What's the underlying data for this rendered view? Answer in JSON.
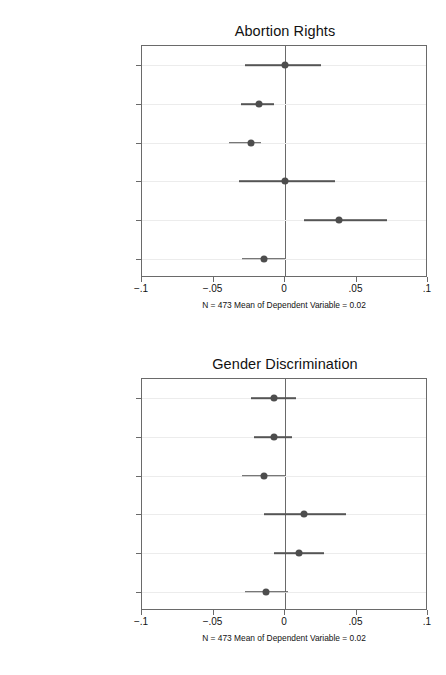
{
  "figure": {
    "categories": [
      "Female, Same Party",
      "Male, Different Party",
      "Male, Same Party",
      "Nominee Qualifications",
      "Nominee Judge",
      "Senator Relection Year"
    ],
    "xticks": [
      "−.1",
      "−.05",
      "0",
      ".05",
      ".1"
    ],
    "xtickvalues": [
      -0.1,
      -0.05,
      0,
      0.05,
      0.1
    ],
    "note": "N = 473 Mean of Dependent Variable = 0.02",
    "colors": {
      "point": "#4d4d4d",
      "interval": "#555555",
      "axis": "#6a6a6a",
      "grid": "#ececec",
      "text": "#111111",
      "background": "#ffffff"
    }
  },
  "chart_data": [
    {
      "type": "scatter",
      "title": "Abortion Rights",
      "xlabel": "",
      "ylabel": "",
      "xlim": [
        -0.1,
        0.1
      ],
      "grid": true,
      "legend": "none",
      "orientation": "horizontal",
      "annotation": "N = 473 Mean of Dependent Variable = 0.02",
      "categories": [
        "Female, Same Party",
        "Male, Different Party",
        "Male, Same Party",
        "Nominee Qualifications",
        "Nominee Judge",
        "Senator Relection Year"
      ],
      "values": [
        0.0,
        -0.018,
        -0.024,
        0.0,
        0.038,
        -0.015
      ],
      "ci_low": [
        -0.028,
        -0.031,
        -0.039,
        -0.032,
        0.013,
        -0.03
      ],
      "ci_high": [
        0.025,
        -0.008,
        -0.017,
        0.035,
        0.071,
        0.0
      ],
      "xticks": [
        -0.1,
        -0.05,
        0,
        0.05,
        0.1
      ],
      "xticklabels": [
        "−.1",
        "−.05",
        "0",
        ".05",
        ".1"
      ]
    },
    {
      "type": "scatter",
      "title": "Gender Discrimination",
      "xlabel": "",
      "ylabel": "",
      "xlim": [
        -0.1,
        0.1
      ],
      "grid": true,
      "legend": "none",
      "orientation": "horizontal",
      "annotation": "N = 473 Mean of Dependent Variable = 0.02",
      "categories": [
        "Female, Same Party",
        "Male, Different Party",
        "Male, Same Party",
        "Nominee Qualifications",
        "Nominee Judge",
        "Senator Relection Year"
      ],
      "values": [
        -0.008,
        -0.008,
        -0.015,
        0.013,
        0.01,
        -0.013
      ],
      "ci_low": [
        -0.024,
        -0.022,
        -0.03,
        -0.015,
        -0.008,
        -0.028
      ],
      "ci_high": [
        0.008,
        0.005,
        0.0,
        0.043,
        0.027,
        0.002
      ],
      "xticks": [
        -0.1,
        -0.05,
        0,
        0.05,
        0.1
      ],
      "xticklabels": [
        "−.1",
        "−.05",
        "0",
        ".05",
        ".1"
      ]
    }
  ]
}
